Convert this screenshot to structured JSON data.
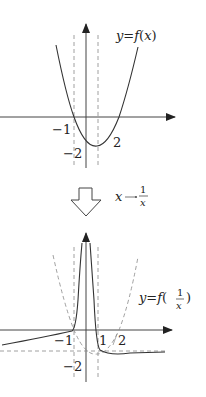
{
  "top_graph": {
    "label": "y=f(x)",
    "label_parts": {
      "y": "y",
      "eq": "=",
      "f": "f",
      "lp": "(",
      "x": "x",
      "rp": ")"
    },
    "tick_labels": {
      "neg1": "−1",
      "neg2": "−2",
      "pos2": "2"
    }
  },
  "transform": {
    "label_x": "x",
    "label_arrow": "→",
    "label_num": "1",
    "label_den": "x"
  },
  "bottom_graph": {
    "label_parts": {
      "y": "y",
      "eq": "=",
      "f": "f",
      "lp": "(",
      "num": "1",
      "den": "x",
      "rp": ")"
    },
    "tick_labels": {
      "neg1": "−1",
      "neg2": "−2",
      "pos1": "1",
      "pos2": "2"
    }
  },
  "colors": {
    "stroke": "#333333",
    "dashed": "#888888"
  }
}
